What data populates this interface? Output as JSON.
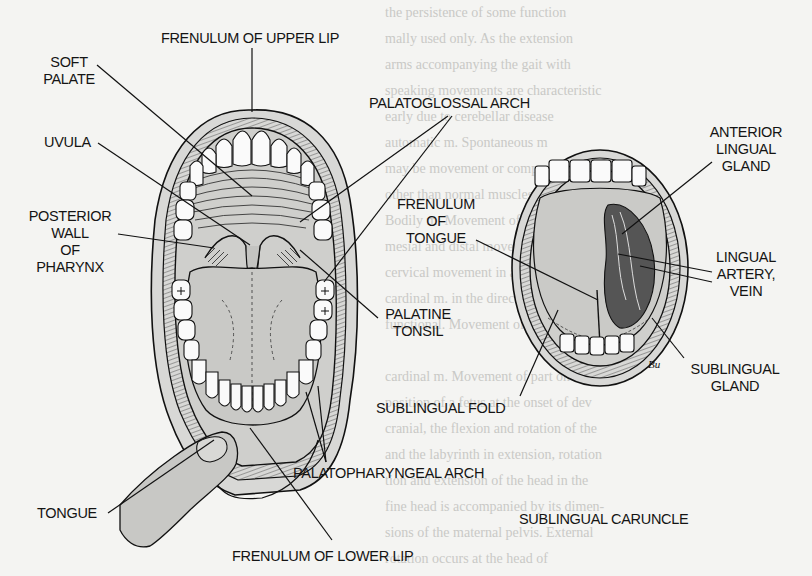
{
  "figure": {
    "left_view": "Open mouth, anterior view with tongue depressed",
    "right_view": "Open mouth with tongue elevated, underside of tongue",
    "signature": "Bu"
  },
  "labels": {
    "frenulum_upper_lip": [
      "FRENULUM OF UPPER LIP"
    ],
    "soft_palate": [
      "SOFT",
      "PALATE"
    ],
    "uvula": [
      "UVULA"
    ],
    "palatoglossal_arch": [
      "PALATOGLOSSAL ARCH"
    ],
    "posterior_wall_pharynx": [
      "POSTERIOR",
      "WALL",
      "OF",
      "PHARYNX"
    ],
    "tongue": [
      "TONGUE"
    ],
    "palatine_tonsil": [
      "PALATINE",
      "TONSIL"
    ],
    "palatopharyngeal_arch": [
      "PALATOPHARYNGEAL ARCH"
    ],
    "frenulum_lower_lip": [
      "FRENULUM OF LOWER LIP"
    ],
    "frenulum_tongue": [
      "FRENULUM",
      "OF",
      "TONGUE"
    ],
    "anterior_lingual_gland": [
      "ANTERIOR",
      "LINGUAL",
      "GLAND"
    ],
    "lingual_artery_vein": [
      "LINGUAL",
      "ARTERY,",
      "VEIN"
    ],
    "sublingual_gland": [
      "SUBLINGUAL",
      "GLAND"
    ],
    "sublingual_fold": [
      "SUBLINGUAL FOLD"
    ],
    "sublingual_caruncle": [
      "SUBLINGUAL CARUNCLE"
    ]
  },
  "bleed_through_text": [
    "the persistence of some function",
    "mally used only. As the extension",
    "arms accompanying the gait with",
    "speaking movements are characteristic",
    "early due to cerebellar disease",
    "  automatic m. Spontaneous m",
    "may be movement or component of exte",
    "  other than normal muscles.",
    "  Bodily m. Movement of a tooth by",
    "mesial and distal movement so that the",
    "cervical movement in a horizontal",
    "cardinal m. in the direction of inclination",
    "  functional. Movement of one rotation",
    "",
    "  cardinal m. Movement of part on the",
    "position of a fetus at the onset of dev",
    "  cranial, the flexion and rotation of the",
    "  and the labyrinth in extension, rotation",
    "tion and extension of the head in the",
    "fine head is accompanied by its dimen-",
    "sions of the maternal pelvis. External",
    "rotation occurs at the head of",
    "  movement.",
    "  ciliary m. Rhythmic movement of the",
    "cilia of a ciliated cell or epithelium.",
    "  spontaneous m.",
    "  curious m. This movement appears"
  ]
}
